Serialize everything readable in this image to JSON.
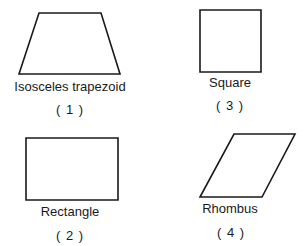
{
  "figures": [
    {
      "id": "trapezoid",
      "name": "Isosceles trapezoid",
      "number": "( 1 )",
      "points": "39,13 101,13 120,74 19,74",
      "label_x": 70,
      "label_y": 80,
      "number_x": 70,
      "number_y": 103
    },
    {
      "id": "rectangle",
      "name": "Rectangle",
      "number": "( 2 )",
      "points": "26,138 118,138 118,200 26,200",
      "label_x": 70,
      "label_y": 205,
      "number_x": 70,
      "number_y": 229
    },
    {
      "id": "square",
      "name": "Square",
      "number": "( 3 )",
      "points": "200,10 261,10 261,72 200,72",
      "label_x": 230,
      "label_y": 76,
      "number_x": 230,
      "number_y": 99
    },
    {
      "id": "rhombus",
      "name": "Rhombus",
      "number": "( 4 )",
      "points": "234,134 295,134 262,197 200,197",
      "label_x": 230,
      "label_y": 202,
      "number_x": 231,
      "number_y": 226
    }
  ],
  "stroke_color": "#1a1a1a"
}
